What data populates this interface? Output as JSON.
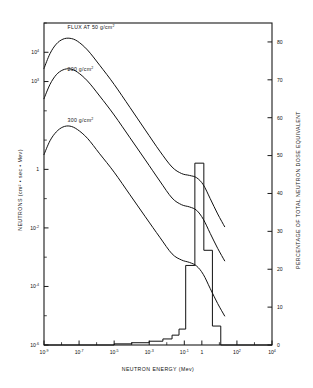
{
  "chart_data": {
    "type": "line",
    "title": "",
    "xlabel": "NEUTRON ENERGY (Mev)",
    "ylabel": "NEUTRONS (cm² • sec • Mev)",
    "y2label": "PERCENTAGE OF TOTAL NEUTRON DOSE EQUIVALENT",
    "grid": false,
    "legend_position": "inline-annotations",
    "xscale": "log",
    "yscale": "log",
    "xlim": [
      1e-09,
      10000.0
    ],
    "ylim": [
      1e-06,
      100000.0
    ],
    "y2lim": [
      0,
      85
    ],
    "xticks": [
      {
        "value": 1e-09,
        "mantissa": "10",
        "exponent": "-9"
      },
      {
        "value": 1e-08,
        "mantissa": "10",
        "exponent": "-8"
      },
      {
        "value": 1e-07,
        "mantissa": "10",
        "exponent": "-7"
      },
      {
        "value": 1e-06,
        "mantissa": "10",
        "exponent": "-6"
      },
      {
        "value": 1e-05,
        "mantissa": "10",
        "exponent": "-5"
      },
      {
        "value": 0.0001,
        "mantissa": "10",
        "exponent": "-4"
      },
      {
        "value": 0.001,
        "mantissa": "10",
        "exponent": "-3"
      },
      {
        "value": 0.01,
        "mantissa": "10",
        "exponent": "-2"
      },
      {
        "value": 0.1,
        "mantissa": "10",
        "exponent": "-1"
      },
      {
        "value": 1.0,
        "mantissa": "1",
        "exponent": ""
      },
      {
        "value": 10.0,
        "mantissa": "10",
        "exponent": ""
      },
      {
        "value": 100.0,
        "mantissa": "10",
        "exponent": "2"
      },
      {
        "value": 1000.0,
        "mantissa": "10",
        "exponent": "3"
      },
      {
        "value": 10000.0,
        "mantissa": "10",
        "exponent": "4"
      }
    ],
    "xticks_labeled": [
      1e-09,
      1e-07,
      1e-05,
      0.001,
      0.1,
      1.0,
      100.0,
      10000.0
    ],
    "yticks": [
      {
        "value": 100000.0,
        "mantissa": "10",
        "exponent": "5"
      },
      {
        "value": 10000.0,
        "mantissa": "10",
        "exponent": "4"
      },
      {
        "value": 1000.0,
        "mantissa": "10",
        "exponent": "3"
      },
      {
        "value": 100.0,
        "mantissa": "10",
        "exponent": "2"
      },
      {
        "value": 10.0,
        "mantissa": "10",
        "exponent": ""
      },
      {
        "value": 1.0,
        "mantissa": "1",
        "exponent": ""
      },
      {
        "value": 0.1,
        "mantissa": "10",
        "exponent": "-1"
      },
      {
        "value": 0.01,
        "mantissa": "10",
        "exponent": "-2"
      },
      {
        "value": 0.001,
        "mantissa": "10",
        "exponent": "-3"
      },
      {
        "value": 0.0001,
        "mantissa": "10",
        "exponent": "-4"
      },
      {
        "value": 1e-05,
        "mantissa": "10",
        "exponent": "-5"
      },
      {
        "value": 1e-06,
        "mantissa": "10",
        "exponent": "-6"
      }
    ],
    "yticks_labeled": [
      10000.0,
      1000.0,
      1.0,
      0.01,
      0.0001,
      1e-06
    ],
    "y2ticks": [
      0,
      10,
      20,
      30,
      40,
      50,
      60,
      70,
      80
    ],
    "annotations": [
      {
        "name": "curve-label-50",
        "text": "FLUX AT 50 g/cm",
        "sup": "2",
        "x": 2.2e-08,
        "y": 60000.0
      },
      {
        "name": "curve-label-200",
        "text": "200 g/cm",
        "sup": "2",
        "x": 2.2e-08,
        "y": 2300.0
      },
      {
        "name": "curve-label-300",
        "text": "300 g/cm",
        "sup": "2",
        "x": 2.2e-08,
        "y": 42.0
      }
    ],
    "series": [
      {
        "name": "FLUX AT 50 g/cm2",
        "points": [
          [
            1e-09,
            2800.0
          ],
          [
            2.2e-09,
            9000.0
          ],
          [
            5e-09,
            19000.0
          ],
          [
            1.2e-08,
            28000.0
          ],
          [
            3e-08,
            30000.0
          ],
          [
            8e-08,
            24000.0
          ],
          [
            3e-07,
            12000.0
          ],
          [
            1.5e-06,
            3600.0
          ],
          [
            1e-05,
            800.0
          ],
          [
            8e-05,
            130.0
          ],
          [
            0.0006,
            22.0
          ],
          [
            0.004,
            4.2
          ],
          [
            0.02,
            1.2
          ],
          [
            0.07,
            0.72
          ],
          [
            0.2,
            0.62
          ],
          [
            0.5,
            0.52
          ],
          [
            1.2,
            0.3
          ],
          [
            3.0,
            0.1
          ],
          [
            8.0,
            0.03
          ],
          [
            20.0,
            0.011
          ]
        ]
      },
      {
        "name": "200 g/cm2",
        "points": [
          [
            1e-09,
            260.0
          ],
          [
            2.2e-09,
            800.0
          ],
          [
            5e-09,
            1700.0
          ],
          [
            1.2e-08,
            2500.0
          ],
          [
            3e-08,
            2700.0
          ],
          [
            8e-08,
            2100.0
          ],
          [
            3e-07,
            1050.0
          ],
          [
            1.5e-06,
            320.0
          ],
          [
            1e-05,
            72.0
          ],
          [
            8e-05,
            12.0
          ],
          [
            0.0006,
            2.1
          ],
          [
            0.004,
            0.4
          ],
          [
            0.02,
            0.105
          ],
          [
            0.07,
            0.062
          ],
          [
            0.2,
            0.052
          ],
          [
            0.5,
            0.04
          ],
          [
            1.2,
            0.02
          ],
          [
            3.0,
            0.0065
          ],
          [
            8.0,
            0.002
          ],
          [
            20.0,
            0.00075
          ]
        ]
      },
      {
        "name": "300 g/cm2",
        "points": [
          [
            1e-09,
            3.2
          ],
          [
            2.2e-09,
            9.5
          ],
          [
            5e-09,
            19.0
          ],
          [
            1.2e-08,
            28.0
          ],
          [
            3e-08,
            30.0
          ],
          [
            8e-08,
            23.0
          ],
          [
            3e-07,
            11.5
          ],
          [
            1.5e-06,
            3.4
          ],
          [
            1e-05,
            0.8
          ],
          [
            8e-05,
            0.135
          ],
          [
            0.0006,
            0.024
          ],
          [
            0.004,
            0.0048
          ],
          [
            0.02,
            0.0013
          ],
          [
            0.07,
            0.0008
          ],
          [
            0.2,
            0.00066
          ],
          [
            0.5,
            0.0005
          ],
          [
            1.2,
            0.00026
          ],
          [
            3.0,
            8.5e-05
          ],
          [
            8.0,
            2.6e-05
          ],
          [
            20.0,
            9.8e-06
          ]
        ]
      }
    ],
    "dose_histogram": {
      "name": "Percentage of total neutron dose equivalent",
      "axis": "right",
      "bins": [
        {
          "x0": 1e-09,
          "x1": 1e-05,
          "value": 0.0
        },
        {
          "x0": 1e-05,
          "x1": 0.0001,
          "value": 0.3
        },
        {
          "x0": 0.0001,
          "x1": 0.001,
          "value": 0.6
        },
        {
          "x0": 0.001,
          "x1": 0.006,
          "value": 1.0
        },
        {
          "x0": 0.006,
          "x1": 0.02,
          "value": 1.6
        },
        {
          "x0": 0.02,
          "x1": 0.05,
          "value": 2.6
        },
        {
          "x0": 0.05,
          "x1": 0.12,
          "value": 4.2
        },
        {
          "x0": 0.12,
          "x1": 0.4,
          "value": 21.0
        },
        {
          "x0": 0.4,
          "x1": 1.3,
          "value": 48.0
        },
        {
          "x0": 1.3,
          "x1": 4.0,
          "value": 25.0
        },
        {
          "x0": 4.0,
          "x1": 12.0,
          "value": 5.0
        },
        {
          "x0": 12.0,
          "x1": 10000.0,
          "value": 0.0
        }
      ]
    }
  }
}
